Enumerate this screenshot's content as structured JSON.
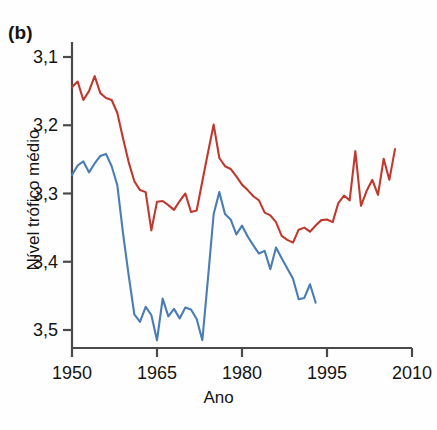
{
  "panel": {
    "label": "(b)"
  },
  "axes": {
    "xlabel": "Ano",
    "ylabel": "Nível trófico médio",
    "x_ticks": [
      "1950",
      "1965",
      "1980",
      "1995",
      "2010"
    ],
    "y_ticks": [
      "3,5",
      "3,4",
      "3,3",
      "3,2",
      "3,1"
    ]
  },
  "chart_data": {
    "type": "line",
    "title": "",
    "subtitle": "",
    "xlabel": "Ano",
    "ylabel": "Nível trófico médio",
    "xlim": [
      1950,
      2010
    ],
    "ylim": [
      3.06,
      3.53
    ],
    "x_ticks": [
      1950,
      1965,
      1980,
      1995,
      2010
    ],
    "y_ticks": [
      3.1,
      3.2,
      3.3,
      3.4,
      3.5
    ],
    "grid": false,
    "legend": "none",
    "decimal_separator": ",",
    "series": [
      {
        "name": "serie-vermelha",
        "color": "#c0392f",
        "x": [
          1950,
          1951,
          1952,
          1953,
          1954,
          1955,
          1956,
          1957,
          1958,
          1959,
          1960,
          1961,
          1962,
          1963,
          1964,
          1965,
          1966,
          1967,
          1968,
          1969,
          1970,
          1971,
          1972,
          1973,
          1974,
          1975,
          1976,
          1977,
          1978,
          1979,
          1980,
          1981,
          1982,
          1983,
          1984,
          1985,
          1986,
          1987,
          1988,
          1989,
          1990,
          1991,
          1992,
          1993,
          1994,
          1995,
          1996,
          1997,
          1998,
          1999,
          2000,
          2001,
          2002,
          2003,
          2004,
          2005,
          2006,
          2007
        ],
        "y": [
          3.456,
          3.464,
          3.437,
          3.45,
          3.472,
          3.447,
          3.44,
          3.437,
          3.418,
          3.381,
          3.346,
          3.318,
          3.305,
          3.302,
          3.246,
          3.288,
          3.289,
          3.283,
          3.276,
          3.289,
          3.3,
          3.273,
          3.275,
          3.318,
          3.36,
          3.401,
          3.352,
          3.34,
          3.336,
          3.325,
          3.313,
          3.305,
          3.296,
          3.29,
          3.272,
          3.268,
          3.258,
          3.238,
          3.232,
          3.228,
          3.247,
          3.25,
          3.244,
          3.253,
          3.261,
          3.262,
          3.258,
          3.286,
          3.297,
          3.29,
          3.362,
          3.282,
          3.304,
          3.32,
          3.298,
          3.351,
          3.32,
          3.365
        ]
      },
      {
        "name": "serie-azul",
        "color": "#4a7cb5",
        "x": [
          1950,
          1951,
          1952,
          1953,
          1954,
          1955,
          1956,
          1957,
          1958,
          1959,
          1960,
          1961,
          1962,
          1963,
          1964,
          1965,
          1966,
          1967,
          1968,
          1969,
          1970,
          1971,
          1972,
          1973,
          1974,
          1975,
          1976,
          1977,
          1978,
          1979,
          1980,
          1981,
          1982,
          1983,
          1984,
          1985,
          1986,
          1987,
          1988,
          1989,
          1990,
          1991,
          1992,
          1993
        ],
        "y": [
          3.327,
          3.341,
          3.347,
          3.331,
          3.344,
          3.355,
          3.358,
          3.34,
          3.312,
          3.242,
          3.18,
          3.123,
          3.112,
          3.134,
          3.122,
          3.085,
          3.146,
          3.12,
          3.131,
          3.117,
          3.133,
          3.13,
          3.116,
          3.085,
          3.176,
          3.27,
          3.302,
          3.27,
          3.262,
          3.24,
          3.253,
          3.237,
          3.224,
          3.212,
          3.216,
          3.189,
          3.221,
          3.205,
          3.19,
          3.175,
          3.145,
          3.147,
          3.167,
          3.14
        ]
      }
    ]
  },
  "geometry": {
    "plot_left": 72,
    "plot_right": 412,
    "plot_top": 42,
    "plot_bottom": 348,
    "y_for_3_5": 57,
    "y_for_3_1": 330
  }
}
